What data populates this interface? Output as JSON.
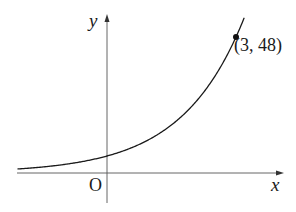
{
  "figure": {
    "axes": {
      "x_label": "x",
      "y_label": "y",
      "origin_label": "O"
    },
    "point": {
      "label": "(3, 48)",
      "x": 3,
      "y": 48
    },
    "colors": {
      "curve": "#1a1a1a",
      "axes": "#555555",
      "point": "#111111",
      "background": "#ffffff"
    }
  },
  "chart_data": {
    "type": "line",
    "title": "",
    "xlabel": "x",
    "ylabel": "y",
    "curve": "exponential, y = 6·2^x",
    "series": [
      {
        "name": "y = 6·2^x",
        "x": [
          -2,
          -1,
          0,
          1,
          2,
          3
        ],
        "values": [
          1.5,
          3,
          6,
          12,
          24,
          48
        ]
      }
    ],
    "annotations": [
      {
        "text": "(3, 48)",
        "x": 3,
        "y": 48,
        "marker": "filled-circle"
      },
      {
        "text": "O",
        "x": 0,
        "y": 0
      }
    ],
    "grid": false,
    "legend": "none"
  }
}
